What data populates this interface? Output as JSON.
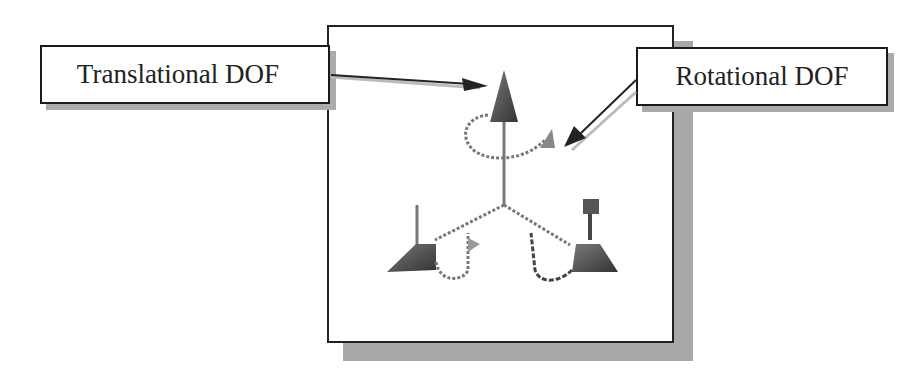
{
  "diagram": {
    "labels": {
      "translational": "Translational DOF",
      "rotational": "Rotational DOF"
    },
    "icons": {
      "center": "triad-dof-symbol",
      "translational_arrow": "arrow-pointer",
      "rotational_arrow": "arrow-pointer"
    },
    "colors": {
      "border": "#1a1a1a",
      "shadow": "#a8a8a8",
      "cone": "#555555",
      "background": "#ffffff"
    }
  }
}
